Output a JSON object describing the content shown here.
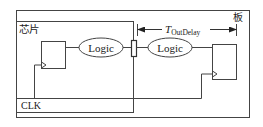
{
  "diagram": {
    "board_label": "板",
    "chip_label": "芯片",
    "clock_label": "CLK",
    "logic_left": "Logic",
    "logic_right": "Logic",
    "timing_label": {
      "main": "T",
      "subscript": "OutDelay"
    },
    "colors": {
      "stroke": "#333333",
      "background": "#ffffff",
      "text": "#222222"
    }
  }
}
